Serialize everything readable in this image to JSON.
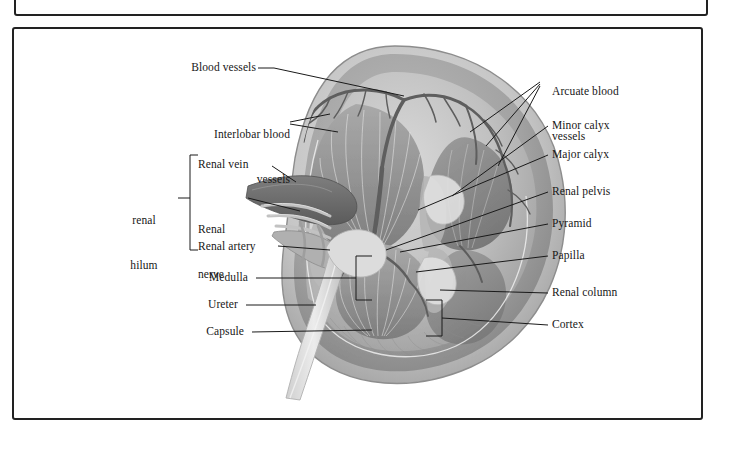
{
  "figure": {
    "illustration_name": "kidney-sectioned-illustration",
    "style": "grayscale anatomical illustration",
    "colors": {
      "frame_border": "#222222",
      "leader_line": "#1a1a1a",
      "text": "#171717",
      "capsule": "#c9c9c9",
      "cortex": "#a6a6a6",
      "medulla_pyramid": "#8f8f8f",
      "renal_column": "#b4b4b4",
      "pelvis": "#d8d8d8",
      "vessel_dark": "#6e6e6e",
      "vessel_light": "#d0d0d0",
      "background": "#ffffff"
    }
  },
  "labels_left": [
    {
      "id": "blood-vessels",
      "text": "Blood vessels"
    },
    {
      "id": "interlobar-blood-vessels",
      "line1": "Interlobar blood",
      "line2": "vessels"
    },
    {
      "id": "renal-vein",
      "text": "Renal vein"
    },
    {
      "id": "renal-nerve",
      "line1": "Renal",
      "line2": "nerve"
    },
    {
      "id": "renal-artery",
      "text": "Renal artery"
    },
    {
      "id": "medulla",
      "text": "Medulla"
    },
    {
      "id": "ureter",
      "text": "Ureter"
    },
    {
      "id": "capsule",
      "text": "Capsule"
    }
  ],
  "labels_right": [
    {
      "id": "arcuate-blood-vessels",
      "line1": "Arcuate blood",
      "line2": "vessels"
    },
    {
      "id": "minor-calyx",
      "text": "Minor calyx"
    },
    {
      "id": "major-calyx",
      "text": "Major calyx"
    },
    {
      "id": "renal-pelvis",
      "text": "Renal pelvis"
    },
    {
      "id": "pyramid",
      "text": "Pyramid"
    },
    {
      "id": "papilla",
      "text": "Papilla"
    },
    {
      "id": "renal-column",
      "text": "Renal column"
    },
    {
      "id": "cortex",
      "text": "Cortex"
    }
  ],
  "bracket_group": {
    "id": "renal-hilum",
    "line1": "renal",
    "line2": "hilum",
    "members": [
      "Renal vein",
      "Renal nerve",
      "Renal artery"
    ]
  }
}
